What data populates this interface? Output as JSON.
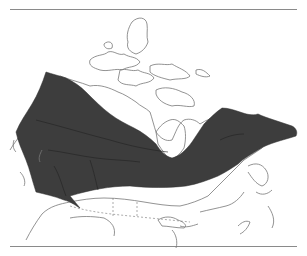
{
  "map": {
    "subject": "Canada species range map",
    "region": "Canada and northern United States",
    "colors": {
      "range_fill": "#3d3d3d",
      "outline": "#777777",
      "background": "#ffffff",
      "rule": "#8a8a8a"
    },
    "layers": [
      {
        "name": "coastline-outline",
        "style": "thin gray line"
      },
      {
        "name": "international-border",
        "style": "dashed line"
      },
      {
        "name": "species-range",
        "style": "dark gray fill",
        "extent": "Yukon and northern British Columbia east across the boreal zone to Quebec and Labrador"
      }
    ]
  }
}
